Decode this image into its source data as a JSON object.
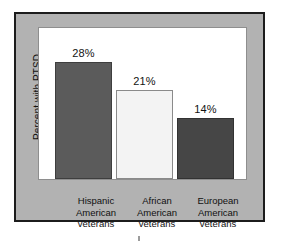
{
  "figure": {
    "frame_color": "#1c1c1c",
    "panel_color": "#b2b2b2",
    "canvas_color": "#ffffff",
    "artifact_mark": ""
  },
  "axis": {
    "y_label": "Percent with PTSD"
  },
  "bars": [
    {
      "key": "hispanic",
      "value_label": "28%",
      "line1": "Hispanic",
      "line2": "American",
      "line3": "veterans",
      "color": "#5b5b5b"
    },
    {
      "key": "african",
      "value_label": "21%",
      "line1": "African",
      "line2": "American",
      "line3": "veterans",
      "color": "#f3f3f3"
    },
    {
      "key": "european",
      "value_label": "14%",
      "line1": "European",
      "line2": "American",
      "line3": "veterans",
      "color": "#464646"
    }
  ],
  "chart_data": {
    "type": "bar",
    "title": "",
    "subtitle": "",
    "xlabel": "",
    "ylabel": "Percent with PTSD",
    "categories": [
      "Hispanic American veterans",
      "African American veterans",
      "European American veterans"
    ],
    "category_lines": [
      [
        "Hispanic",
        "American",
        "veterans"
      ],
      [
        "African",
        "American",
        "veterans"
      ],
      [
        "European",
        "American",
        "veterans"
      ]
    ],
    "values": [
      28,
      21,
      14
    ],
    "value_labels": [
      "28%",
      "21%",
      "14%"
    ],
    "unit": "%",
    "ylim": [
      0,
      36.6
    ],
    "yticks": [],
    "ytick_labels": [],
    "grid": false,
    "legend": false,
    "legend_position": "none",
    "bar_colors": [
      "#5b5b5b",
      "#f3f3f3",
      "#464646"
    ],
    "bar_edge_colors": [
      "#3e3e3e",
      "#8a8a8a",
      "#323232"
    ],
    "data_labels_position": "above-bar",
    "orientation": "vertical",
    "annotations": []
  }
}
